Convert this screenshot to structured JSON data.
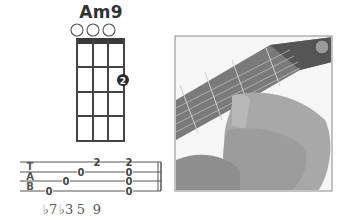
{
  "chord": {
    "name": "Am9",
    "instrument_strings": 4,
    "frets_shown": 4,
    "open_strings": [
      1,
      2,
      3
    ],
    "fingers": [
      {
        "string": 4,
        "fret": 2,
        "label": "2"
      }
    ]
  },
  "tab": {
    "clef": [
      "T",
      "A",
      "B"
    ],
    "notes": [
      {
        "line": 4,
        "value": "0"
      },
      {
        "line": 3,
        "value": "0"
      },
      {
        "line": 2,
        "value": "0"
      },
      {
        "line": 1,
        "value": "2"
      }
    ],
    "chord": [
      "2",
      "0",
      "0",
      "0"
    ]
  },
  "intervals": [
    "♭7",
    "♭3",
    "5",
    "9"
  ],
  "photo": {
    "alt": "hand fretting Am9 chord on ukulele neck"
  },
  "colors": {
    "ink": "#333333",
    "photo_bg": "#f2f2f2",
    "neck": "#6e6e6e"
  }
}
